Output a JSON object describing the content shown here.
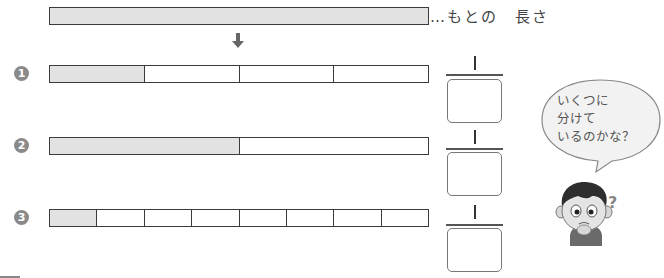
{
  "original": {
    "label": "…もとの　長さ",
    "fill_color": "#e2e2e2"
  },
  "arrow": {
    "icon": "arrow-down-icon",
    "glyph": "🡇"
  },
  "rows": [
    {
      "number": "1",
      "segments": 4,
      "shaded": 1
    },
    {
      "number": "2",
      "segments": 2,
      "shaded": 1
    },
    {
      "number": "3",
      "segments": 8,
      "shaded": 1
    }
  ],
  "fractions": [
    {
      "numerator": "1",
      "denominator": ""
    },
    {
      "numerator": "1",
      "denominator": ""
    },
    {
      "numerator": "1",
      "denominator": ""
    }
  ],
  "bubble": {
    "lines": [
      "いくつに",
      "分けて",
      "いるのかな？"
    ]
  },
  "character": {
    "icon": "thinking-boy-icon",
    "question_mark": "?"
  }
}
